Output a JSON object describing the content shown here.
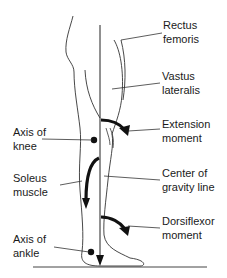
{
  "figure": {
    "labels": {
      "rectus_femoris": [
        "Rectus",
        "femoris"
      ],
      "vastus_lateralis": [
        "Vastus",
        "lateralis"
      ],
      "extension_moment": [
        "Extension",
        "moment"
      ],
      "axis_of_knee": [
        "Axis of",
        "knee"
      ],
      "soleus_muscle": [
        "Soleus",
        "muscle"
      ],
      "center_of_gravity_line": [
        "Center of",
        "gravity line"
      ],
      "dorsiflexor_moment": [
        "Dorsiflexor",
        "moment"
      ],
      "axis_of_ankle": [
        "Axis of",
        "ankle"
      ]
    },
    "colors": {
      "line": "#222222",
      "arrow": "#111111",
      "background": "#ffffff"
    }
  }
}
